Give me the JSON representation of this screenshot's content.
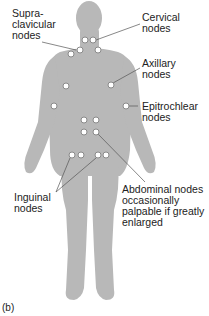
{
  "figure": {
    "panel_label": "(b)",
    "body_color": "#b8b8b8",
    "node_color": "#ffffff",
    "node_stroke": "#8a8a8a",
    "leader_color": "#555555"
  },
  "labels": {
    "supraclavicular": "Supra-\nclavicular\nnodes",
    "cervical": "Cervical\nnodes",
    "axillary": "Axillary\nnodes",
    "epitrochlear": "Epitrochlear\nnodes",
    "inguinal": "Inguinal\nnodes",
    "abdominal": "Abdominal nodes\noccasionally\npalpable if greatly\nenlarged"
  },
  "nodes": [
    {
      "group": "cervical",
      "x": 85,
      "y": 40
    },
    {
      "group": "cervical",
      "x": 93,
      "y": 40
    },
    {
      "group": "supraclavicular",
      "x": 71,
      "y": 54
    },
    {
      "group": "supraclavicular",
      "x": 80,
      "y": 50
    },
    {
      "group": "cervical",
      "x": 98,
      "y": 50
    },
    {
      "group": "axillary",
      "x": 66,
      "y": 86
    },
    {
      "group": "axillary",
      "x": 111,
      "y": 85
    },
    {
      "group": "epitrochlear",
      "x": 54,
      "y": 106
    },
    {
      "group": "epitrochlear",
      "x": 126,
      "y": 106
    },
    {
      "group": "abdominal",
      "x": 84,
      "y": 120
    },
    {
      "group": "abdominal",
      "x": 96,
      "y": 120
    },
    {
      "group": "abdominal",
      "x": 84,
      "y": 132
    },
    {
      "group": "abdominal",
      "x": 96,
      "y": 132
    },
    {
      "group": "inguinal",
      "x": 72,
      "y": 155
    },
    {
      "group": "inguinal",
      "x": 81,
      "y": 155
    },
    {
      "group": "inguinal",
      "x": 98,
      "y": 155
    },
    {
      "group": "inguinal",
      "x": 106,
      "y": 155
    }
  ]
}
